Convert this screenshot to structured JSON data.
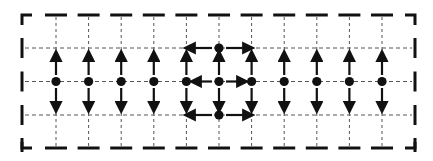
{
  "canvas": {
    "width": 433,
    "height": 161,
    "background": "#ffffff",
    "ink": "#111111",
    "grid_ink": "#555555"
  },
  "frame": {
    "left": 22,
    "right": 415,
    "top": 15,
    "bottom": 148,
    "corner_len": 10,
    "dash_len": 11,
    "tick_len": 16
  },
  "grid": {
    "columns_x": [
      56,
      88.6,
      121.2,
      153.8,
      186.4,
      219,
      251.6,
      284.2,
      316.8,
      349.4,
      382
    ],
    "rows_y": [
      48,
      81.5,
      115
    ],
    "center_col_index": 5
  },
  "nodes": [
    {
      "col": 0,
      "row": 1
    },
    {
      "col": 1,
      "row": 1
    },
    {
      "col": 2,
      "row": 1
    },
    {
      "col": 3,
      "row": 1
    },
    {
      "col": 4,
      "row": 1
    },
    {
      "col": 5,
      "row": 1
    },
    {
      "col": 6,
      "row": 1
    },
    {
      "col": 7,
      "row": 1
    },
    {
      "col": 8,
      "row": 1
    },
    {
      "col": 9,
      "row": 1
    },
    {
      "col": 10,
      "row": 1
    },
    {
      "col": 5,
      "row": 0
    },
    {
      "col": 5,
      "row": 2
    }
  ],
  "arrows": {
    "vertical_columns": [
      0,
      1,
      2,
      3,
      4,
      5,
      6,
      7,
      8,
      9,
      10
    ],
    "vertical_up": {
      "from": 75,
      "to": 52
    },
    "vertical_down": {
      "from": 88,
      "to": 111
    },
    "horizontal": [
      {
        "row": 0,
        "from": 212,
        "to": 186
      },
      {
        "row": 0,
        "from": 226,
        "to": 252
      },
      {
        "row": 1,
        "from": 212,
        "to": 192
      },
      {
        "row": 1,
        "from": 226,
        "to": 246
      },
      {
        "row": 2,
        "from": 212,
        "to": 186
      },
      {
        "row": 2,
        "from": 226,
        "to": 252
      }
    ]
  }
}
